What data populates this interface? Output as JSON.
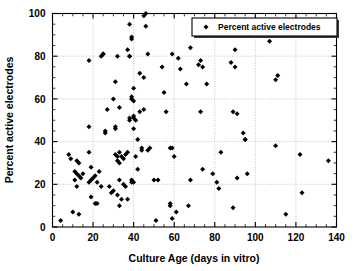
{
  "chart_data": {
    "type": "scatter",
    "title": "",
    "xlabel": "Culture Age (days in vitro)",
    "ylabel": "Percent active electrodes",
    "xlim": [
      0,
      140
    ],
    "ylim": [
      0,
      100
    ],
    "xticks": [
      0,
      20,
      40,
      60,
      80,
      100,
      120,
      140
    ],
    "yticks": [
      0,
      20,
      40,
      60,
      80,
      100
    ],
    "x_minor_tick_step": 5,
    "y_minor_tick_step": 5,
    "grid": true,
    "grid_style": "dotted",
    "legend_position": "top-right",
    "marker": "diamond",
    "marker_color": "#000000",
    "series": [
      {
        "name": "Percent active electrodes",
        "points": [
          [
            4,
            3
          ],
          [
            8,
            34
          ],
          [
            9,
            32
          ],
          [
            10,
            7
          ],
          [
            11,
            22
          ],
          [
            11,
            26
          ],
          [
            12,
            25
          ],
          [
            12,
            19
          ],
          [
            12,
            31
          ],
          [
            13,
            24
          ],
          [
            13,
            6
          ],
          [
            13,
            30
          ],
          [
            14,
            23
          ],
          [
            15,
            25
          ],
          [
            18,
            78
          ],
          [
            18,
            47
          ],
          [
            18,
            35
          ],
          [
            18,
            21
          ],
          [
            19,
            14
          ],
          [
            19,
            22
          ],
          [
            19,
            28
          ],
          [
            20,
            23
          ],
          [
            21,
            24
          ],
          [
            21,
            11
          ],
          [
            22,
            11
          ],
          [
            22,
            21
          ],
          [
            23,
            26
          ],
          [
            24,
            19
          ],
          [
            24,
            80
          ],
          [
            25,
            81
          ],
          [
            25,
            81
          ],
          [
            26,
            44
          ],
          [
            26,
            45
          ],
          [
            27,
            55
          ],
          [
            28,
            19
          ],
          [
            29,
            16
          ],
          [
            30,
            60
          ],
          [
            30,
            17
          ],
          [
            31,
            46
          ],
          [
            31,
            47
          ],
          [
            31,
            68
          ],
          [
            31,
            34
          ],
          [
            32,
            31
          ],
          [
            32,
            33
          ],
          [
            32,
            15
          ],
          [
            32,
            80
          ],
          [
            33,
            10
          ],
          [
            33,
            56
          ],
          [
            33,
            22
          ],
          [
            33,
            30
          ],
          [
            33,
            35
          ],
          [
            34,
            13
          ],
          [
            34,
            33
          ],
          [
            35,
            20
          ],
          [
            35,
            32
          ],
          [
            36,
            19
          ],
          [
            36,
            34
          ],
          [
            37,
            83
          ],
          [
            37,
            35
          ],
          [
            37,
            13
          ],
          [
            38,
            95
          ],
          [
            38,
            80
          ],
          [
            38,
            80
          ],
          [
            38,
            50
          ],
          [
            38,
            51
          ],
          [
            39,
            88
          ],
          [
            39,
            89
          ],
          [
            39,
            61
          ],
          [
            39,
            60
          ],
          [
            39,
            22
          ],
          [
            39,
            21
          ],
          [
            40,
            65
          ],
          [
            40,
            59
          ],
          [
            40,
            52
          ],
          [
            40,
            51
          ],
          [
            40,
            46
          ],
          [
            40,
            21
          ],
          [
            41,
            50
          ],
          [
            41,
            33
          ],
          [
            42,
            41
          ],
          [
            42,
            27
          ],
          [
            43,
            72
          ],
          [
            43,
            54
          ],
          [
            44,
            36
          ],
          [
            44,
            37
          ],
          [
            45,
            99
          ],
          [
            45,
            70
          ],
          [
            45,
            55
          ],
          [
            46,
            100
          ],
          [
            46,
            94
          ],
          [
            47,
            81
          ],
          [
            47,
            36
          ],
          [
            48,
            37
          ],
          [
            50,
            22
          ],
          [
            51,
            3
          ],
          [
            52,
            22
          ],
          [
            54,
            75
          ],
          [
            55,
            63
          ],
          [
            56,
            54
          ],
          [
            58,
            11
          ],
          [
            58,
            10
          ],
          [
            58,
            37
          ],
          [
            59,
            37
          ],
          [
            59,
            4
          ],
          [
            59,
            81
          ],
          [
            60,
            33
          ],
          [
            61,
            7
          ],
          [
            62,
            79
          ],
          [
            63,
            74
          ],
          [
            66,
            67
          ],
          [
            67,
            10
          ],
          [
            68,
            84
          ],
          [
            68,
            22
          ],
          [
            72,
            76
          ],
          [
            73,
            54
          ],
          [
            73,
            78
          ],
          [
            74,
            75
          ],
          [
            74,
            27
          ],
          [
            76,
            67
          ],
          [
            79,
            25
          ],
          [
            81,
            21
          ],
          [
            82,
            18
          ],
          [
            83,
            35
          ],
          [
            88,
            77
          ],
          [
            89,
            54
          ],
          [
            89,
            9
          ],
          [
            90,
            83
          ],
          [
            90,
            75
          ],
          [
            91,
            53
          ],
          [
            91,
            23
          ],
          [
            94,
            44
          ],
          [
            95,
            41
          ],
          [
            95,
            41
          ],
          [
            96,
            25
          ],
          [
            107,
            87
          ],
          [
            110,
            38
          ],
          [
            110,
            69
          ],
          [
            111,
            71
          ],
          [
            115,
            6
          ],
          [
            122,
            34
          ],
          [
            123,
            16
          ],
          [
            136,
            31
          ]
        ]
      }
    ]
  },
  "legend": {
    "entries": [
      {
        "label": "Percent active electrodes",
        "marker": "diamond"
      }
    ]
  },
  "axes": {
    "x": {
      "label": "Culture Age (days in vitro)",
      "tick_labels": [
        "0",
        "20",
        "40",
        "60",
        "80",
        "100",
        "120",
        "140"
      ]
    },
    "y": {
      "label": "Percent active electrodes",
      "tick_labels": [
        "0",
        "20",
        "40",
        "60",
        "80",
        "100"
      ]
    }
  }
}
